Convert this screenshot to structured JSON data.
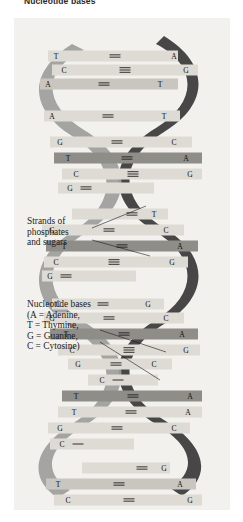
{
  "caption": {
    "text": "Nucleotide bases"
  },
  "figure": {
    "background_color": "#f2f1ee",
    "back_strand_color": "#3d3d3d",
    "front_strand_color": "#9a9a9a",
    "rung_light_color": "#dedbd4",
    "rung_mid_color": "#c9c6bf",
    "rung_dark_color": "#8f8d88"
  },
  "annotations": [
    {
      "id": "strands",
      "lines": [
        "Strands of",
        "phosphates",
        "and sugars"
      ],
      "text": "Strands of\nphosphates\nand sugars"
    },
    {
      "id": "bases",
      "lines": [
        "Nucleotide bases",
        "(A = Adenine,",
        "T = Thymine,",
        "G = Guanine,",
        "C = Cytosine)"
      ],
      "text": "Nucleotide bases\n(A = Adenine,\nT = Thymine,\nG = Guanine,\nC = Cytosine)"
    }
  ],
  "legend": {
    "title": "Nucleotide bases",
    "entries": [
      {
        "code": "A",
        "name": "Adenine"
      },
      {
        "code": "T",
        "name": "Thymine"
      },
      {
        "code": "G",
        "name": "Guanine"
      },
      {
        "code": "C",
        "name": "Cytosine"
      }
    ]
  },
  "base_pairs": [
    {
      "index": 0,
      "y": 38,
      "left": "T",
      "right": "A",
      "bonds": 2,
      "shade": "light",
      "x_left": 42,
      "x_right": 160,
      "width": 130,
      "x": 34
    },
    {
      "index": 1,
      "y": 52,
      "left": "C",
      "right": "G",
      "bonds": 3,
      "shade": "light",
      "x_left": 50,
      "x_right": 172,
      "width": 146,
      "x": 38
    },
    {
      "index": 2,
      "y": 66,
      "left": "A",
      "right": "T",
      "bonds": 2,
      "shade": "mid",
      "x_left": 34,
      "x_right": 146,
      "width": 138,
      "x": 26
    },
    {
      "index": 3,
      "y": 98,
      "left": "A",
      "right": "T",
      "bonds": 2,
      "shade": "light",
      "x_left": 38,
      "x_right": 150,
      "width": 136,
      "x": 30
    },
    {
      "index": 4,
      "y": 124,
      "left": "G",
      "right": "C",
      "bonds": 2,
      "shade": "light",
      "x_left": 46,
      "x_right": 160,
      "width": 142,
      "x": 36
    },
    {
      "index": 5,
      "y": 140,
      "left": "T",
      "right": "A",
      "bonds": 2,
      "shade": "dark",
      "x_left": 54,
      "x_right": 172,
      "width": 148,
      "x": 40
    },
    {
      "index": 6,
      "y": 156,
      "left": "C",
      "right": "G",
      "bonds": 3,
      "shade": "light",
      "x_left": 62,
      "x_right": 176,
      "width": 140,
      "x": 48
    },
    {
      "index": 7,
      "y": 170,
      "left": "G",
      "right": "",
      "bonds": 2,
      "shade": "light",
      "x_left": 56,
      "x_right": 0,
      "width": 96,
      "x": 44
    },
    {
      "index": 8,
      "y": 196,
      "left": "",
      "right": "T",
      "bonds": 2,
      "shade": "light",
      "x_left": 0,
      "x_right": 140,
      "width": 96,
      "x": 58
    },
    {
      "index": 9,
      "y": 212,
      "left": "G",
      "right": "C",
      "bonds": 2,
      "shade": "light",
      "x_left": 38,
      "x_right": 152,
      "width": 142,
      "x": 28
    },
    {
      "index": 10,
      "y": 228,
      "left": "T",
      "right": "A",
      "bonds": 2,
      "shade": "dark",
      "x_left": 50,
      "x_right": 166,
      "width": 152,
      "x": 32
    },
    {
      "index": 11,
      "y": 244,
      "left": "C",
      "right": "G",
      "bonds": 3,
      "shade": "light",
      "x_left": 42,
      "x_right": 158,
      "width": 144,
      "x": 30
    },
    {
      "index": 12,
      "y": 258,
      "left": "G",
      "right": "",
      "bonds": 2,
      "shade": "light",
      "x_left": 36,
      "x_right": 0,
      "width": 94,
      "x": 28
    },
    {
      "index": 13,
      "y": 286,
      "left": "C",
      "right": "G",
      "bonds": 2,
      "shade": "light",
      "x_left": 44,
      "x_right": 134,
      "width": 112,
      "x": 38
    },
    {
      "index": 14,
      "y": 300,
      "left": "G",
      "right": "C",
      "bonds": 2,
      "shade": "light",
      "x_left": 38,
      "x_right": 152,
      "width": 140,
      "x": 30
    },
    {
      "index": 15,
      "y": 316,
      "left": "T",
      "right": "A",
      "bonds": 2,
      "shade": "dark",
      "x_left": 52,
      "x_right": 168,
      "width": 148,
      "x": 36
    },
    {
      "index": 16,
      "y": 332,
      "left": "C",
      "right": "G",
      "bonds": 3,
      "shade": "light",
      "x_left": 58,
      "x_right": 172,
      "width": 142,
      "x": 44
    },
    {
      "index": 17,
      "y": 346,
      "left": "G",
      "right": "C",
      "bonds": 2,
      "shade": "light",
      "x_left": 64,
      "x_right": 140,
      "width": 104,
      "x": 54
    },
    {
      "index": 18,
      "y": 362,
      "left": "C",
      "right": "",
      "bonds": 1,
      "shade": "light",
      "x_left": 88,
      "x_right": 0,
      "width": 70,
      "x": 74
    },
    {
      "index": 19,
      "y": 378,
      "left": "T",
      "right": "A",
      "bonds": 2,
      "shade": "dark",
      "x_left": 62,
      "x_right": 176,
      "width": 140,
      "x": 48
    },
    {
      "index": 20,
      "y": 394,
      "left": "T",
      "right": "A",
      "bonds": 2,
      "shade": "light",
      "x_left": 60,
      "x_right": 174,
      "width": 144,
      "x": 44
    },
    {
      "index": 21,
      "y": 410,
      "left": "G",
      "right": "C",
      "bonds": 2,
      "shade": "light",
      "x_left": 46,
      "x_right": 160,
      "width": 142,
      "x": 34
    },
    {
      "index": 22,
      "y": 426,
      "left": "C",
      "right": "",
      "bonds": 1,
      "shade": "light",
      "x_left": 48,
      "x_right": 0,
      "width": 84,
      "x": 36
    },
    {
      "index": 23,
      "y": 450,
      "left": "",
      "right": "G",
      "bonds": 2,
      "shade": "light",
      "x_left": 0,
      "x_right": 150,
      "width": 88,
      "x": 68
    },
    {
      "index": 24,
      "y": 466,
      "left": "T",
      "right": "A",
      "bonds": 2,
      "shade": "mid",
      "x_left": 44,
      "x_right": 166,
      "width": 150,
      "x": 32
    },
    {
      "index": 25,
      "y": 482,
      "left": "C",
      "right": "G",
      "bonds": 2,
      "shade": "light",
      "x_left": 54,
      "x_right": 176,
      "width": 148,
      "x": 40
    }
  ]
}
